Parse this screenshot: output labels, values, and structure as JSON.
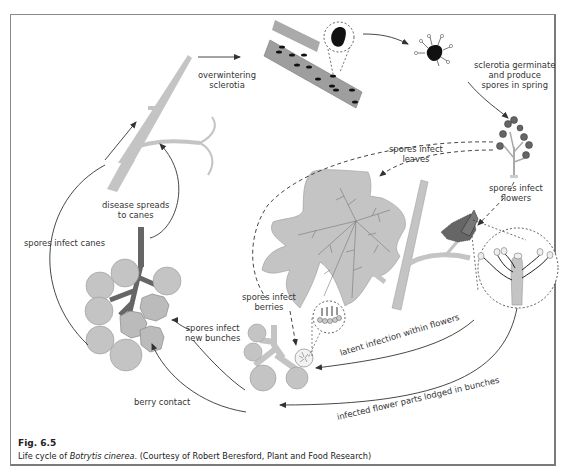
{
  "figure": {
    "number": "Fig. 6.5",
    "caption_prefix": "Life cycle of ",
    "caption_species": "Botrytis cinerea",
    "caption_suffix": ". (Courtesy of Robert Beresford, Plant and Food Research)"
  },
  "labels": {
    "overwintering": [
      "overwintering",
      "sclerotia"
    ],
    "germinate": [
      "sclerotia germinate",
      "and produce",
      "spores in spring"
    ],
    "infect_leaves": [
      "spores infect",
      "leaves"
    ],
    "infect_flowers": [
      "spores infect",
      "flowers"
    ],
    "infect_berries": [
      "spores infect",
      "berries"
    ],
    "infect_new_bunches": [
      "spores infect",
      "new bunches"
    ],
    "disease_spreads": [
      "disease spreads",
      "to canes"
    ],
    "infect_canes": "spores infect canes",
    "berry_contact": "berry contact",
    "latent_infection": "latent infection within flowers",
    "flower_parts_lodged": "infected flower parts lodged in bunches"
  },
  "colors": {
    "plant_gray": "#c4c4c4",
    "plant_stroke": "#8f8f8f",
    "dark_stem": "#6e6e6e",
    "sclerotia": "#111111",
    "arrow": "#333333",
    "frame": "#8a8a8a"
  }
}
